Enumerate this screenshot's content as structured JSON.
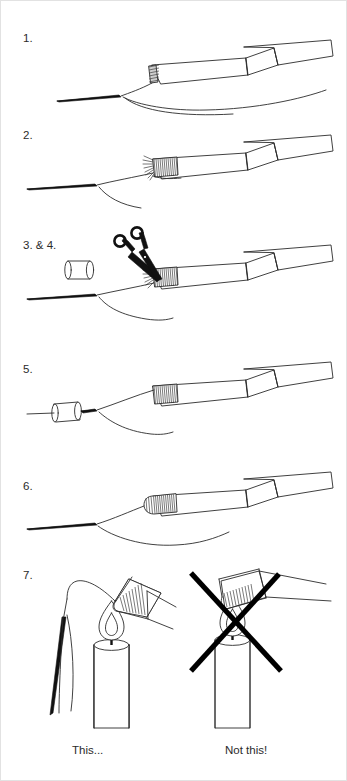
{
  "document": {
    "title": "Line whipping and sealing instructions",
    "background_color": "#ffffff",
    "ink_color": "#2b2b2b",
    "width": 347,
    "height": 781
  },
  "steps": [
    {
      "id": "step-1",
      "label": "1.",
      "illustration": "tape-strip-with-hatched-end-and-line",
      "elements": [
        "ribbon-strip",
        "hatched-end-cap",
        "fishing-line",
        "line-loop"
      ]
    },
    {
      "id": "step-2",
      "label": "2.",
      "illustration": "line-whipped-with-thread-windings",
      "elements": [
        "ribbon-strip",
        "thread-whipping",
        "frayed-thread-ends",
        "fishing-line",
        "line-loop"
      ]
    },
    {
      "id": "step-3-4",
      "label": "3. & 4.",
      "illustration": "trimming-whipping-with-scissors-and-ferrule",
      "elements": [
        "scissors",
        "ferrule-tube",
        "ribbon-strip",
        "thread-whipping",
        "fishing-line",
        "line-loop"
      ]
    },
    {
      "id": "step-5",
      "label": "5.",
      "illustration": "ferrule-threaded-onto-line",
      "elements": [
        "ferrule-tube",
        "ribbon-strip",
        "thread-whipping",
        "fishing-line",
        "line-loop"
      ]
    },
    {
      "id": "step-6",
      "label": "6.",
      "illustration": "finished-whipped-assembly",
      "elements": [
        "ribbon-strip",
        "thread-whipping",
        "fishing-line",
        "line-loop"
      ]
    },
    {
      "id": "step-7",
      "label": "7.",
      "illustration": "candle-sealing-correct-versus-incorrect",
      "elements": [
        "candle-correct",
        "candle-incorrect",
        "flame",
        "needle-and-thread",
        "whipped-tip",
        "x-mark"
      ]
    }
  ],
  "captions": {
    "correct": "This...",
    "incorrect": "Not this!"
  }
}
